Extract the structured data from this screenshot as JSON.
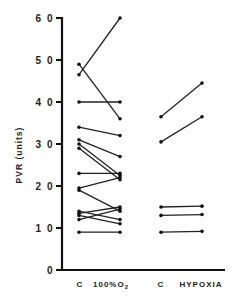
{
  "chart_data": {
    "type": "line",
    "title": "",
    "xlabel": "",
    "ylabel": "PVR (units)",
    "ylim": [
      0,
      60
    ],
    "yticks": [
      0,
      10,
      20,
      30,
      40,
      50,
      60
    ],
    "ytick_labels": [
      "0",
      "10",
      "20",
      "30",
      "40",
      "50",
      "60"
    ],
    "grid": false,
    "legend": null,
    "categories": [
      "C",
      "100%O2",
      "C",
      "HYPOXIA"
    ],
    "groups": [
      {
        "name": "100% O2",
        "x_labels": [
          "C",
          "100%O2"
        ],
        "pairs": [
          [
            46.5,
            60
          ],
          [
            49,
            36
          ],
          [
            40,
            40
          ],
          [
            34,
            32
          ],
          [
            31,
            27
          ],
          [
            30,
            22.5
          ],
          [
            29,
            21.5
          ],
          [
            23,
            23
          ],
          [
            19.5,
            22
          ],
          [
            19,
            14
          ],
          [
            14,
            12
          ],
          [
            13.5,
            15
          ],
          [
            13,
            11
          ],
          [
            12,
            14.5
          ],
          [
            9,
            9
          ]
        ]
      },
      {
        "name": "HYPOXIA",
        "x_labels": [
          "C",
          "HYPOXIA"
        ],
        "pairs": [
          [
            36.5,
            44.5
          ],
          [
            30.5,
            36.5
          ],
          [
            15,
            15.2
          ],
          [
            13,
            13.2
          ],
          [
            9,
            9.2
          ]
        ]
      }
    ]
  },
  "labels": {
    "y_title": "PVR (units)",
    "x1": "C",
    "x2_main": "100%O",
    "x2_sub": "2",
    "x3": "C",
    "x4": "HYPOXIA"
  }
}
